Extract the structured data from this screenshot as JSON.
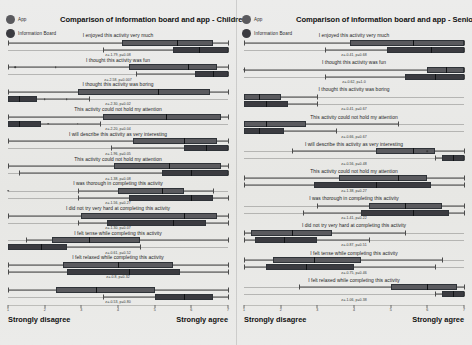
{
  "legend": {
    "items": [
      {
        "label": "App",
        "color": "#5a5a5e"
      },
      {
        "label": "Information Board",
        "color": "#3b3b40"
      }
    ]
  },
  "axis": {
    "left_label": "Strongly disagree",
    "right_label": "Strongly agree",
    "ticks": [
      "1",
      "2",
      "3",
      "4",
      "5",
      "6",
      "7"
    ]
  },
  "panels": [
    {
      "id": "children",
      "title": "Comparison of information board and app - Children",
      "questions": [
        {
          "label": "I enjoyed this activity very much",
          "stat": "z=-1.79, p=0.08",
          "app": {
            "min": 1.0,
            "q1": 4.1,
            "median": 5.6,
            "q3": 6.6,
            "max": 7.0,
            "outliers": []
          },
          "board": {
            "min": 3.6,
            "q1": 5.5,
            "median": 6.2,
            "q3": 7.0,
            "max": 7.0,
            "outliers": []
          }
        },
        {
          "label": "I thought this activity was fun",
          "stat": "z=-2.58, p=0.007",
          "app": {
            "min": 1.0,
            "q1": 4.3,
            "median": 5.9,
            "q3": 6.7,
            "max": 7.0,
            "outliers": [
              1.2,
              2.3
            ]
          },
          "board": {
            "min": 4.5,
            "q1": 6.1,
            "median": 6.6,
            "q3": 7.0,
            "max": 7.0,
            "outliers": []
          }
        },
        {
          "label": "I thought this activity was boring",
          "stat": "z=-2.30, p=0.02",
          "app": {
            "min": 1.0,
            "q1": 2.9,
            "median": 5.1,
            "q3": 6.5,
            "max": 7.0,
            "outliers": []
          },
          "board": {
            "min": 1.0,
            "q1": 1.0,
            "median": 1.3,
            "q3": 1.8,
            "max": 3.2,
            "outliers": [
              2.0,
              2.6
            ]
          }
        },
        {
          "label": "This activity could not hold my attention",
          "stat": "z=-2.20, p=0.04",
          "app": {
            "min": 1.0,
            "q1": 3.6,
            "median": 5.3,
            "q3": 6.8,
            "max": 7.0,
            "outliers": []
          },
          "board": {
            "min": 1.0,
            "q1": 1.0,
            "median": 1.3,
            "q3": 1.9,
            "max": 3.5,
            "outliers": [
              2.1,
              2.9
            ]
          }
        },
        {
          "label": "I will describe this activity as very interesting",
          "stat": "z=-1.96, p=0.05",
          "app": {
            "min": 1.0,
            "q1": 4.4,
            "median": 5.8,
            "q3": 6.7,
            "max": 7.0,
            "outliers": []
          },
          "board": {
            "min": 3.8,
            "q1": 5.8,
            "median": 6.4,
            "q3": 7.0,
            "max": 7.0,
            "outliers": []
          }
        },
        {
          "label": "This activity could not hold my attention",
          "stat": "z=-1.38, p=0.08",
          "app": {
            "min": 1.0,
            "q1": 3.9,
            "median": 5.4,
            "q3": 6.8,
            "max": 7.0,
            "outliers": []
          },
          "board": {
            "min": 1.3,
            "q1": 5.2,
            "median": 6.0,
            "q3": 7.0,
            "max": 7.0,
            "outliers": []
          }
        },
        {
          "label": "I was thorough in completing this activity",
          "stat": "z=-1.56, p=0.27",
          "app": {
            "min": 2.9,
            "q1": 4.0,
            "median": 5.2,
            "q3": 5.8,
            "max": 6.6,
            "outliers": [
              0.6
            ]
          },
          "board": {
            "min": 2.9,
            "q1": 4.3,
            "median": 6.0,
            "q3": 6.6,
            "max": 7.0,
            "outliers": []
          }
        },
        {
          "label": "I did not try very hard at completing this activity",
          "stat": "z=-1.30, p=0.07",
          "app": {
            "min": 1.0,
            "q1": 3.0,
            "median": 5.8,
            "q3": 6.7,
            "max": 7.0,
            "outliers": []
          },
          "board": {
            "min": 2.9,
            "q1": 3.7,
            "median": 5.5,
            "q3": 6.4,
            "max": 7.0,
            "outliers": []
          }
        },
        {
          "label": "I felt tense while completing this activity",
          "stat": "z=-0.61, p=0.52",
          "app": {
            "min": 1.5,
            "q1": 2.2,
            "median": 3.2,
            "q3": 4.6,
            "max": 7.0,
            "outliers": []
          },
          "board": {
            "min": 1.0,
            "q1": 1.0,
            "median": 1.9,
            "q3": 2.6,
            "max": 4.6,
            "outliers": []
          }
        },
        {
          "label": "I felt relaxed while completing this activity",
          "stat": "z=-0.8, p=0.32",
          "app": {
            "min": 1.0,
            "q1": 2.5,
            "median": 4.0,
            "q3": 5.5,
            "max": 7.0,
            "outliers": []
          },
          "board": {
            "min": 1.0,
            "q1": 2.6,
            "median": 4.3,
            "q3": 5.7,
            "max": 7.0,
            "outliers": []
          }
        },
        {
          "label": "",
          "stat": "z=-0.53, p=0.80",
          "app": {
            "min": 1.0,
            "q1": 2.3,
            "median": 3.4,
            "q3": 5.0,
            "max": 7.0,
            "outliers": []
          },
          "board": {
            "min": 3.6,
            "q1": 5.0,
            "median": 5.8,
            "q3": 6.6,
            "max": 7.0,
            "outliers": []
          }
        }
      ]
    },
    {
      "id": "seniors",
      "title": "Comparison of information board and app - Seniors",
      "questions": [
        {
          "label": "I enjoyed this activity very much",
          "stat": "z=-0.41, p=0.68",
          "app": {
            "min": 1.0,
            "q1": 3.9,
            "median": 5.6,
            "q3": 7.0,
            "max": 7.0,
            "outliers": []
          },
          "board": {
            "min": 3.2,
            "q1": 4.9,
            "median": 6.1,
            "q3": 7.0,
            "max": 7.0,
            "outliers": []
          }
        },
        {
          "label": "I thought this activity was fun",
          "stat": "z=-0.62, p=1.0",
          "app": {
            "min": 1.0,
            "q1": 6.0,
            "median": 6.5,
            "q3": 7.0,
            "max": 7.0,
            "outliers": [
              0.6
            ]
          },
          "board": {
            "min": 3.2,
            "q1": 5.4,
            "median": 6.2,
            "q3": 7.0,
            "max": 7.0,
            "outliers": []
          }
        },
        {
          "label": "I thought this activity was boring",
          "stat": "z=-0.41, p=0.67",
          "app": {
            "min": 1.0,
            "q1": 1.0,
            "median": 1.4,
            "q3": 2.0,
            "max": 3.0,
            "outliers": []
          },
          "board": {
            "min": 1.0,
            "q1": 1.0,
            "median": 1.6,
            "q3": 2.2,
            "max": 3.0,
            "outliers": []
          }
        },
        {
          "label": "This activity could not hold my attention",
          "stat": "z=-0.66, p=0.67",
          "app": {
            "min": 1.0,
            "q1": 1.0,
            "median": 1.6,
            "q3": 2.7,
            "max": 5.2,
            "outliers": []
          },
          "board": {
            "min": 1.0,
            "q1": 1.0,
            "median": 1.4,
            "q3": 2.1,
            "max": 3.5,
            "outliers": []
          }
        },
        {
          "label": "I will describe this activity as very interesting",
          "stat": "z=-0.56, p=0.48",
          "app": {
            "min": 2.3,
            "q1": 4.6,
            "median": 5.6,
            "q3": 6.2,
            "max": 7.0,
            "outliers": [
              6.0
            ]
          },
          "board": {
            "min": 6.2,
            "q1": 6.4,
            "median": 6.7,
            "q3": 7.0,
            "max": 7.0,
            "outliers": []
          }
        },
        {
          "label": "This activity could not hold my attention",
          "stat": "z=-1.38, p=0.27",
          "app": {
            "min": 1.0,
            "q1": 3.6,
            "median": 5.2,
            "q3": 6.0,
            "max": 7.0,
            "outliers": []
          },
          "board": {
            "min": 1.0,
            "q1": 2.9,
            "median": 4.6,
            "q3": 6.1,
            "max": 7.0,
            "outliers": []
          }
        },
        {
          "label": "I was thorough in completing this activity",
          "stat": "z=-1.41, p=0.22",
          "app": {
            "min": 3.0,
            "q1": 4.4,
            "median": 5.4,
            "q3": 6.4,
            "max": 7.0,
            "outliers": []
          },
          "board": {
            "min": 2.6,
            "q1": 4.2,
            "median": 5.6,
            "q3": 6.6,
            "max": 7.0,
            "outliers": []
          }
        },
        {
          "label": "I did not try very hard at completing this activity",
          "stat": "z=-0.87, p=0.51",
          "app": {
            "min": 1.0,
            "q1": 1.2,
            "median": 2.3,
            "q3": 3.4,
            "max": 5.4,
            "outliers": []
          },
          "board": {
            "min": 1.0,
            "q1": 1.3,
            "median": 2.1,
            "q3": 3.0,
            "max": 4.4,
            "outliers": []
          }
        },
        {
          "label": "I felt tense while completing this activity",
          "stat": "z=-0.75, p=0.46",
          "app": {
            "min": 1.0,
            "q1": 1.8,
            "median": 2.9,
            "q3": 4.2,
            "max": 6.4,
            "outliers": []
          },
          "board": {
            "min": 1.0,
            "q1": 1.6,
            "median": 2.7,
            "q3": 4.0,
            "max": 6.2,
            "outliers": []
          }
        },
        {
          "label": "I felt relaxed while completing this activity",
          "stat": "z=-1.06, p=0.38",
          "app": {
            "min": 2.5,
            "q1": 5.0,
            "median": 6.0,
            "q3": 6.8,
            "max": 7.0,
            "outliers": []
          },
          "board": {
            "min": 6.2,
            "q1": 6.4,
            "median": 6.7,
            "q3": 7.0,
            "max": 7.0,
            "outliers": []
          }
        }
      ]
    }
  ],
  "chart_data": {
    "type": "box",
    "xlabel": "Likert response",
    "ylabel": "Questionnaire item",
    "xlim": [
      1,
      7
    ],
    "xticks": [
      1,
      2,
      3,
      4,
      5,
      6,
      7
    ],
    "xtick_endpoints": [
      "Strongly disagree",
      "Strongly agree"
    ],
    "grid": false,
    "legend_position": "top-left",
    "series": [
      {
        "name": "App",
        "color": "#5a5a5e"
      },
      {
        "name": "Information Board",
        "color": "#3b3b40"
      }
    ],
    "panels": [
      "Children",
      "Seniors"
    ],
    "annotation_format": "z=<value>, p=<value>"
  }
}
